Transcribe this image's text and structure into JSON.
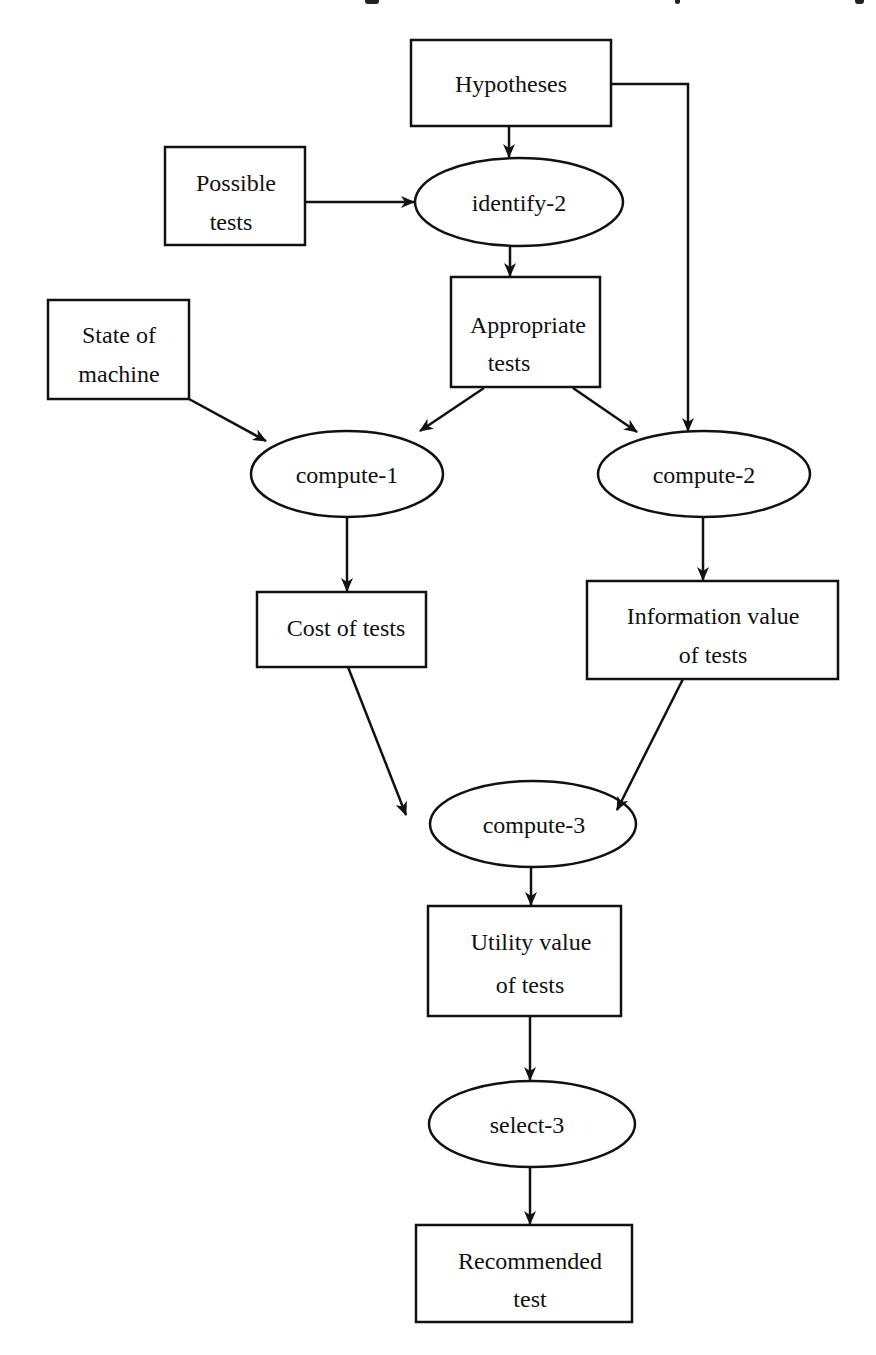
{
  "diagram": {
    "type": "flowchart",
    "stroke_color": "#111111",
    "background": "#ffffff",
    "nodes": [
      {
        "id": "hypotheses",
        "shape": "rect",
        "lines": [
          "Hypotheses"
        ]
      },
      {
        "id": "possible_tests",
        "shape": "rect",
        "lines": [
          "Possible",
          "tests"
        ]
      },
      {
        "id": "identify_2",
        "shape": "ellipse",
        "lines": [
          "identify-2"
        ]
      },
      {
        "id": "appropriate_tests",
        "shape": "rect",
        "lines": [
          "Appropriate",
          "tests"
        ]
      },
      {
        "id": "state_of_machine",
        "shape": "rect",
        "lines": [
          "State of",
          "machine"
        ]
      },
      {
        "id": "compute_1",
        "shape": "ellipse",
        "lines": [
          "compute-1"
        ]
      },
      {
        "id": "compute_2",
        "shape": "ellipse",
        "lines": [
          "compute-2"
        ]
      },
      {
        "id": "cost_of_tests",
        "shape": "rect",
        "lines": [
          "Cost of tests"
        ]
      },
      {
        "id": "information_value",
        "shape": "rect",
        "lines": [
          "Information value",
          "of tests"
        ]
      },
      {
        "id": "compute_3",
        "shape": "ellipse",
        "lines": [
          "compute-3"
        ]
      },
      {
        "id": "utility_value",
        "shape": "rect",
        "lines": [
          "Utility value",
          "of tests"
        ]
      },
      {
        "id": "select_3",
        "shape": "ellipse",
        "lines": [
          "select-3"
        ]
      },
      {
        "id": "recommended_test",
        "shape": "rect",
        "lines": [
          "Recommended",
          "test"
        ]
      }
    ],
    "edges": [
      {
        "from": "hypotheses",
        "to": "identify_2"
      },
      {
        "from": "hypotheses",
        "to": "compute_2"
      },
      {
        "from": "possible_tests",
        "to": "identify_2"
      },
      {
        "from": "identify_2",
        "to": "appropriate_tests"
      },
      {
        "from": "appropriate_tests",
        "to": "compute_1"
      },
      {
        "from": "appropriate_tests",
        "to": "compute_2"
      },
      {
        "from": "state_of_machine",
        "to": "compute_1"
      },
      {
        "from": "compute_1",
        "to": "cost_of_tests"
      },
      {
        "from": "compute_2",
        "to": "information_value"
      },
      {
        "from": "cost_of_tests",
        "to": "compute_3"
      },
      {
        "from": "information_value",
        "to": "compute_3"
      },
      {
        "from": "compute_3",
        "to": "utility_value"
      },
      {
        "from": "utility_value",
        "to": "select_3"
      },
      {
        "from": "select_3",
        "to": "recommended_test"
      }
    ]
  },
  "labels": {
    "hypotheses": "Hypotheses",
    "possible_tests_1": "Possible",
    "possible_tests_2": "tests",
    "identify_2": "identify-2",
    "appropriate_tests_1": "Appropriate",
    "appropriate_tests_2": "tests",
    "state_of_machine_1": "State of",
    "state_of_machine_2": "machine",
    "compute_1": "compute-1",
    "compute_2": "compute-2",
    "cost_of_tests": "Cost of tests",
    "information_value_1": "Information value",
    "information_value_2": "of tests",
    "compute_3": "compute-3",
    "utility_value_1": "Utility value",
    "utility_value_2": "of tests",
    "select_3": "select-3",
    "recommended_test_1": "Recommended",
    "recommended_test_2": "test"
  }
}
